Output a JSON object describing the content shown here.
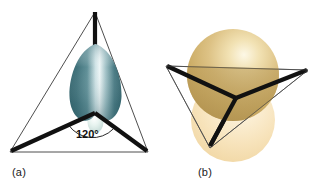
{
  "figure": {
    "background_color": "#ffffff",
    "width": 318,
    "height": 190
  },
  "panels": [
    {
      "id": "a",
      "caption": "(a)",
      "description": "trigonal planar framework with single teal hybrid orbital lobe",
      "angle_annotation": {
        "label": "120°",
        "value": 120,
        "unit": "degrees"
      },
      "colors": {
        "bond": "#111111",
        "wireframe": "#3a3a3a",
        "arc": "#111111",
        "lobe_edge": "#3d6f77",
        "lobe_mid": "#4e7f89",
        "lobe_highlight": "#e8f1f2",
        "back_lobe": "#dfeeea"
      },
      "elements": {
        "bonds": 3,
        "orbital_lobes": 2,
        "wireframe_shape": "triangle"
      }
    },
    {
      "id": "b",
      "caption": "(b)",
      "description": "tilted trigonal planar framework with two overlapping golden spheres",
      "colors": {
        "bond": "#111111",
        "wireframe": "#4a4a4a",
        "sphere_top_edge": "#c9a85f",
        "sphere_top_mid": "#d9bd7c",
        "sphere_top_highlight": "#fcf6e0",
        "sphere_bottom_edge": "#f3d9a4",
        "sphere_bottom_mid": "#f8e6c2",
        "sphere_bottom_highlight": "#fdf4e2"
      },
      "elements": {
        "bonds": 3,
        "spheres": 2,
        "wireframe_shape": "triangle"
      }
    }
  ]
}
